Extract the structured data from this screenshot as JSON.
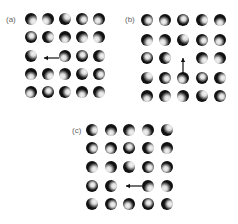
{
  "figure": {
    "panels": [
      {
        "label": "(a)",
        "label_pos": [
          6,
          15
        ],
        "cols": [
          31,
          48,
          65,
          82,
          99
        ],
        "rows": [
          19,
          37,
          56,
          74,
          92
        ],
        "vacancy": [
          2,
          1
        ],
        "arrow": {
          "from": [
            59,
            58
          ],
          "to": [
            44,
            58
          ],
          "direction": "left"
        }
      },
      {
        "label": "(b)",
        "label_pos": [
          125,
          15
        ],
        "cols": [
          147,
          165,
          183,
          202,
          220
        ],
        "rows": [
          20,
          40,
          58,
          78,
          96
        ],
        "vacancy": [
          2,
          2
        ],
        "arrow": {
          "from": [
            183,
            73
          ],
          "to": [
            183,
            58
          ],
          "direction": "up"
        }
      },
      {
        "label": "(c)",
        "label_pos": [
          72,
          126
        ],
        "cols": [
          92,
          111,
          129,
          148,
          167
        ],
        "rows": [
          130,
          148,
          167,
          186,
          204
        ],
        "vacancy": [
          3,
          2
        ],
        "arrow": {
          "from": [
            142,
            186
          ],
          "to": [
            126,
            186
          ],
          "direction": "left"
        }
      }
    ]
  },
  "colors": {
    "atom_dark": "#111111",
    "atom_highlight": "#f4f4f4",
    "arrow": "#111111",
    "label": "#666666"
  }
}
